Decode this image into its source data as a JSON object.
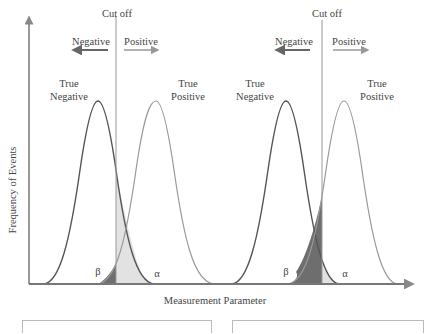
{
  "axes": {
    "y_label": "Frequency of Events",
    "x_label": "Measurement Parameter"
  },
  "panels": [
    {
      "cutoff_label": "Cut off",
      "negative_label": "Negative",
      "positive_label": "Positive",
      "true_negative_label": [
        "True",
        "Negative"
      ],
      "true_positive_label": [
        "True",
        "Positive"
      ],
      "beta_label": "β",
      "alpha_label": "α",
      "shading": "beta small dark, alpha large light"
    },
    {
      "cutoff_label": "Cut off",
      "negative_label": "Negative",
      "positive_label": "Positive",
      "true_negative_label": [
        "True",
        "Negative"
      ],
      "true_positive_label": [
        "True",
        "Positive"
      ],
      "beta_label": "β",
      "alpha_label": "α",
      "shading": "beta large dark, alpha small light"
    }
  ],
  "colors": {
    "axis": "#777777",
    "true_negative_curve": "#555555",
    "true_positive_curve": "#999999",
    "beta_fill": "#6e6e6e",
    "alpha_fill": "#e2e2e2",
    "text": "#444444"
  }
}
